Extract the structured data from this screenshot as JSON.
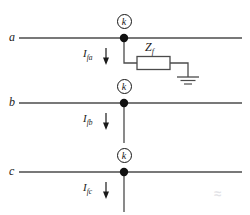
{
  "figure": {
    "type": "single-line-to-ground-fault-circuit"
  },
  "phases": [
    {
      "id": "a",
      "phase_label": "a",
      "node_label": "k",
      "current_label": "I",
      "current_subscript": "fa",
      "line_y": 38,
      "has_fault_branch": true
    },
    {
      "id": "b",
      "phase_label": "b",
      "node_label": "k",
      "current_label": "I",
      "current_subscript": "fb",
      "line_y": 103,
      "has_fault_branch": false
    },
    {
      "id": "c",
      "phase_label": "c",
      "node_label": "k",
      "current_label": "I",
      "current_subscript": "fc",
      "line_y": 172,
      "has_fault_branch": false
    }
  ],
  "impedance": {
    "label": "Z",
    "subscript": "f",
    "element": "resistor-box"
  },
  "ground": {
    "symbol": "earth-ground",
    "bars": 3
  },
  "watermark": {
    "text": "≈"
  },
  "colors": {
    "line": "#4b4b4b",
    "ink": "#1a1a1a",
    "node_fill": "#111111",
    "background": "#ffffff",
    "watermark": "#e2e2e6"
  }
}
